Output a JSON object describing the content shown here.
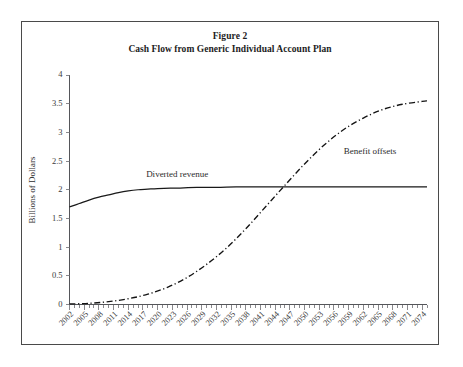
{
  "figure": {
    "title_line1": "Figure 2",
    "title_line2": "Cash Flow from Generic Individual Account Plan",
    "border_color": "#4a4a4a",
    "background": "#ffffff"
  },
  "chart_data": {
    "type": "line",
    "title": "Cash Flow from Generic Individual Account Plan",
    "xlabel": "",
    "ylabel": "Billions of Dollars",
    "ylim": [
      0,
      4
    ],
    "xlim": [
      2002,
      2075
    ],
    "grid": false,
    "legend_position": "inline-annotations",
    "ytick_labels": [
      "0",
      "0.5",
      "1",
      "1.5",
      "2",
      "2.5",
      "3",
      "3.5",
      "4"
    ],
    "ytick_values": [
      0,
      0.5,
      1,
      1.5,
      2,
      2.5,
      3,
      3.5,
      4
    ],
    "xtick_labels": [
      "2002",
      "2005",
      "2008",
      "2011",
      "2014",
      "2017",
      "2020",
      "2023",
      "2026",
      "2029",
      "2032",
      "2035",
      "2038",
      "2041",
      "2044",
      "2047",
      "2050",
      "2053",
      "2056",
      "2059",
      "2062",
      "2065",
      "2068",
      "2071",
      "2074"
    ],
    "xtick_values": [
      2002,
      2005,
      2008,
      2011,
      2014,
      2017,
      2020,
      2023,
      2026,
      2029,
      2032,
      2035,
      2038,
      2041,
      2044,
      2047,
      2050,
      2053,
      2056,
      2059,
      2062,
      2065,
      2068,
      2071,
      2074
    ],
    "minor_tick_interval": 1,
    "annotations": [
      {
        "text": "Diverted revenue",
        "x": 2024,
        "y": 2.22
      },
      {
        "text": "Benefit offsets",
        "x": 2058,
        "y": 2.62
      }
    ],
    "series": [
      {
        "name": "Diverted revenue",
        "style": "solid",
        "color": "#191919",
        "x": [
          2002,
          2004,
          2006,
          2008,
          2010,
          2012,
          2014,
          2016,
          2018,
          2020,
          2024,
          2028,
          2032,
          2036,
          2040,
          2044,
          2048,
          2052,
          2056,
          2060,
          2064,
          2068,
          2072,
          2075
        ],
        "values": [
          1.7,
          1.76,
          1.82,
          1.87,
          1.91,
          1.95,
          1.98,
          2.0,
          2.01,
          2.02,
          2.03,
          2.04,
          2.04,
          2.05,
          2.05,
          2.05,
          2.05,
          2.05,
          2.05,
          2.05,
          2.05,
          2.05,
          2.05,
          2.05
        ]
      },
      {
        "name": "Benefit offsets",
        "style": "dash-dot",
        "color": "#141414",
        "x": [
          2002,
          2006,
          2010,
          2014,
          2018,
          2022,
          2026,
          2030,
          2034,
          2038,
          2042,
          2046,
          2050,
          2054,
          2058,
          2062,
          2066,
          2070,
          2074,
          2075
        ],
        "values": [
          0.01,
          0.02,
          0.05,
          0.1,
          0.18,
          0.3,
          0.47,
          0.7,
          0.98,
          1.32,
          1.7,
          2.08,
          2.45,
          2.78,
          3.05,
          3.25,
          3.4,
          3.49,
          3.54,
          3.55
        ]
      }
    ],
    "crossover": {
      "x": 2047,
      "y": 2.05
    }
  }
}
